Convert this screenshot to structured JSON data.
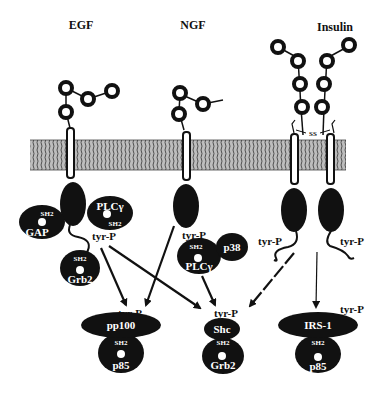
{
  "diagram": {
    "type": "signaling pathway",
    "receptors": [
      {
        "id": "egf",
        "title": "EGF"
      },
      {
        "id": "ngf",
        "title": "NGF"
      },
      {
        "id": "insulin",
        "title": "Insulin",
        "disulfide_label": "SS"
      }
    ],
    "egf_complex": {
      "gap": {
        "name": "GAP",
        "domain": "SH2"
      },
      "plcg": {
        "name": "PLCγ",
        "domain": "SH2"
      },
      "grb2": {
        "name": "Grb2",
        "domain": "SH2"
      },
      "phospho": "tyr-P"
    },
    "ngf_complex": {
      "phospho": "tyr-P",
      "plcg": {
        "name": "PLCγ",
        "domain": "SH2"
      },
      "p38": {
        "name": "p38"
      }
    },
    "insulin_complex": {
      "phospho_left": "tyr-P",
      "phospho_right": "tyr-P"
    },
    "targets": [
      {
        "id": "pp100",
        "phospho": "tyr-P",
        "name": "pp100",
        "domain": "SH2",
        "partner": "p85"
      },
      {
        "id": "shc",
        "phospho": "tyr-P",
        "name": "Shc",
        "domain": "SH2",
        "partner": "Grb2"
      },
      {
        "id": "irs1",
        "phospho": "tyr-P",
        "name": "IRS-1",
        "domain": "SH2",
        "partner": "p85"
      }
    ],
    "colors": {
      "ink": "#111111",
      "background": "#ffffff",
      "membrane": "#9a9a9a"
    }
  }
}
